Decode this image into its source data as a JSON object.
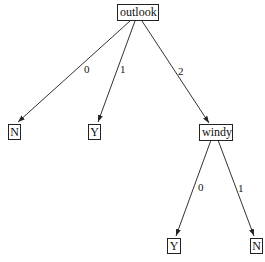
{
  "diagram": {
    "type": "decision-tree",
    "line_color": "#333333",
    "nodes": {
      "root": {
        "label": "outlook"
      },
      "leaf_outlook_0": {
        "label": "N"
      },
      "leaf_outlook_1": {
        "label": "Y"
      },
      "windy": {
        "label": "windy"
      },
      "leaf_windy_0": {
        "label": "Y"
      },
      "leaf_windy_1": {
        "label": "N"
      }
    },
    "edges": [
      {
        "from": "outlook",
        "to": "N",
        "label": "0"
      },
      {
        "from": "outlook",
        "to": "Y",
        "label": "1"
      },
      {
        "from": "outlook",
        "to": "windy",
        "label": "2"
      },
      {
        "from": "windy",
        "to": "Y",
        "label": "0"
      },
      {
        "from": "windy",
        "to": "N",
        "label": "1"
      }
    ]
  }
}
